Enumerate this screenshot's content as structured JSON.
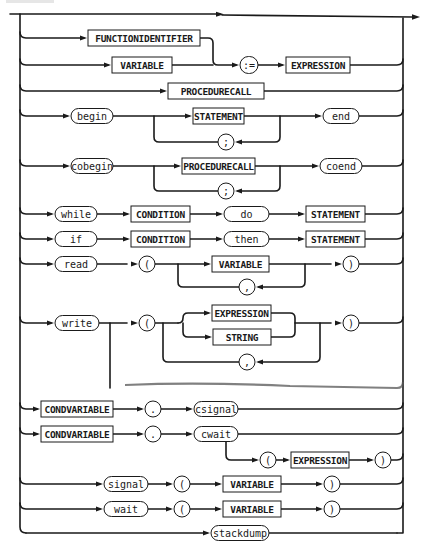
{
  "diagram": {
    "colors": {
      "ink": "#1a1a1a",
      "paper": "#ffffff"
    },
    "nonterminals": [
      {
        "id": "nt-functionidentifier",
        "label": "FUNCTIONIDENTIFIER",
        "x": 88,
        "y": 30,
        "w": 112,
        "h": 16
      },
      {
        "id": "nt-variable-assign",
        "label": "VARIABLE",
        "x": 112,
        "y": 57,
        "w": 60,
        "h": 16
      },
      {
        "id": "nt-expression-assign",
        "label": "EXPRESSION",
        "x": 286,
        "y": 57,
        "w": 64,
        "h": 16
      },
      {
        "id": "nt-procedurecall",
        "label": "PROCEDURECALL",
        "x": 168,
        "y": 83,
        "w": 96,
        "h": 16
      },
      {
        "id": "nt-statement-begin",
        "label": "STATEMENT",
        "x": 193,
        "y": 108,
        "w": 51,
        "h": 16
      },
      {
        "id": "nt-procedurecall-cobegin",
        "label": "PROCEDURECALL",
        "x": 182,
        "y": 158,
        "w": 73,
        "h": 16
      },
      {
        "id": "nt-condition-while",
        "label": "CONDITION",
        "x": 131,
        "y": 206,
        "w": 59,
        "h": 16
      },
      {
        "id": "nt-statement-while",
        "label": "STATEMENT",
        "x": 306,
        "y": 206,
        "w": 59,
        "h": 16
      },
      {
        "id": "nt-condition-if",
        "label": "CONDITION",
        "x": 131,
        "y": 231,
        "w": 59,
        "h": 16
      },
      {
        "id": "nt-statement-if",
        "label": "STATEMENT",
        "x": 306,
        "y": 231,
        "w": 59,
        "h": 16
      },
      {
        "id": "nt-variable-read",
        "label": "VARIABLE",
        "x": 212,
        "y": 256,
        "w": 57,
        "h": 16
      },
      {
        "id": "nt-expression-write",
        "label": "EXPRESSION",
        "x": 212,
        "y": 305,
        "w": 59,
        "h": 16
      },
      {
        "id": "nt-string-write",
        "label": "STRING",
        "x": 213,
        "y": 329,
        "w": 58,
        "h": 16
      },
      {
        "id": "nt-condvariable-csignal",
        "label": "CONDVARIABLE",
        "x": 41,
        "y": 401,
        "w": 72,
        "h": 16
      },
      {
        "id": "nt-condvariable-cwait",
        "label": "CONDVARIABLE",
        "x": 41,
        "y": 426,
        "w": 72,
        "h": 16
      },
      {
        "id": "nt-expression-cwait",
        "label": "EXPRESSION",
        "x": 291,
        "y": 452,
        "w": 58,
        "h": 16
      },
      {
        "id": "nt-variable-signal",
        "label": "VARIABLE",
        "x": 223,
        "y": 476,
        "w": 58,
        "h": 16
      },
      {
        "id": "nt-variable-wait",
        "label": "VARIABLE",
        "x": 223,
        "y": 501,
        "w": 58,
        "h": 16
      }
    ],
    "terminals": [
      {
        "id": "t-assign",
        "label": ":=",
        "x": 240,
        "y": 65,
        "w": 18,
        "h": 17
      },
      {
        "id": "t-begin",
        "label": "begin",
        "x": 71,
        "y": 116,
        "w": 42,
        "h": 15
      },
      {
        "id": "t-end",
        "label": "end",
        "x": 323,
        "y": 116,
        "w": 36,
        "h": 15
      },
      {
        "id": "t-semicolon-begin",
        "label": ";",
        "x": 218,
        "y": 142,
        "w": 16,
        "h": 16
      },
      {
        "id": "t-cobegin",
        "label": "cobegin",
        "x": 71,
        "y": 166,
        "w": 42,
        "h": 15
      },
      {
        "id": "t-coend",
        "label": "coend",
        "x": 320,
        "y": 166,
        "w": 42,
        "h": 15
      },
      {
        "id": "t-semicolon-cobegin",
        "label": ";",
        "x": 218,
        "y": 191,
        "w": 16,
        "h": 16
      },
      {
        "id": "t-while",
        "label": "while",
        "x": 55,
        "y": 214,
        "w": 42,
        "h": 15
      },
      {
        "id": "t-do",
        "label": "do",
        "x": 224,
        "y": 214,
        "w": 45,
        "h": 15
      },
      {
        "id": "t-if",
        "label": "if",
        "x": 55,
        "y": 239,
        "w": 42,
        "h": 15
      },
      {
        "id": "t-then",
        "label": "then",
        "x": 224,
        "y": 239,
        "w": 45,
        "h": 15
      },
      {
        "id": "t-read",
        "label": "read",
        "x": 55,
        "y": 264,
        "w": 42,
        "h": 15
      },
      {
        "id": "t-lparen-read",
        "label": "(",
        "x": 139,
        "y": 264,
        "w": 16,
        "h": 16
      },
      {
        "id": "t-comma-read",
        "label": ",",
        "x": 239,
        "y": 287,
        "w": 16,
        "h": 16
      },
      {
        "id": "t-rparen-read",
        "label": ")",
        "x": 343,
        "y": 264,
        "w": 16,
        "h": 16
      },
      {
        "id": "t-write",
        "label": "write",
        "x": 55,
        "y": 323,
        "w": 44,
        "h": 15
      },
      {
        "id": "t-lparen-write",
        "label": "(",
        "x": 139,
        "y": 323,
        "w": 16,
        "h": 16
      },
      {
        "id": "t-comma-write",
        "label": ",",
        "x": 239,
        "y": 362,
        "w": 16,
        "h": 16
      },
      {
        "id": "t-rparen-write",
        "label": ")",
        "x": 343,
        "y": 323,
        "w": 16,
        "h": 16
      },
      {
        "id": "t-dot-csignal",
        "label": ".",
        "x": 145,
        "y": 409,
        "w": 16,
        "h": 16
      },
      {
        "id": "t-csignal",
        "label": "csignal",
        "x": 194,
        "y": 409,
        "w": 44,
        "h": 15
      },
      {
        "id": "t-dot-cwait",
        "label": ".",
        "x": 145,
        "y": 434,
        "w": 16,
        "h": 16
      },
      {
        "id": "t-cwait",
        "label": "cwait",
        "x": 194,
        "y": 434,
        "w": 44,
        "h": 15
      },
      {
        "id": "t-lparen-cwait",
        "label": "(",
        "x": 260,
        "y": 460,
        "w": 16,
        "h": 16
      },
      {
        "id": "t-rparen-cwait",
        "label": ")",
        "x": 375,
        "y": 460,
        "w": 16,
        "h": 16
      },
      {
        "id": "t-signal",
        "label": "signal",
        "x": 104,
        "y": 484,
        "w": 44,
        "h": 15
      },
      {
        "id": "t-lparen-signal",
        "label": "(",
        "x": 174,
        "y": 484,
        "w": 16,
        "h": 16
      },
      {
        "id": "t-rparen-signal",
        "label": ")",
        "x": 324,
        "y": 484,
        "w": 16,
        "h": 16
      },
      {
        "id": "t-wait",
        "label": "wait",
        "x": 104,
        "y": 509,
        "w": 44,
        "h": 15
      },
      {
        "id": "t-lparen-wait",
        "label": "(",
        "x": 174,
        "y": 509,
        "w": 16,
        "h": 16
      },
      {
        "id": "t-rparen-wait",
        "label": ")",
        "x": 324,
        "y": 509,
        "w": 16,
        "h": 16
      },
      {
        "id": "t-stackdump",
        "label": "stackdump",
        "x": 211,
        "y": 533,
        "w": 58,
        "h": 15
      }
    ]
  }
}
